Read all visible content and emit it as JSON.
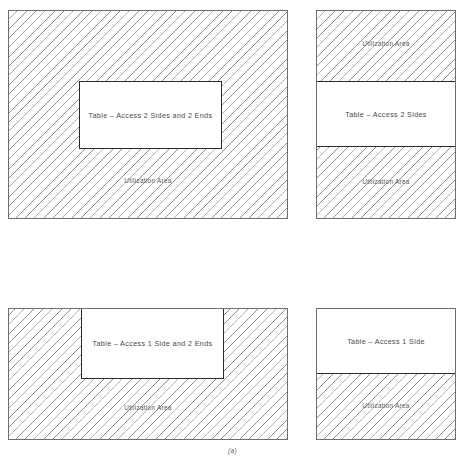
{
  "figure": {
    "caption": "(a)"
  },
  "panels": [
    {
      "id": "top-left",
      "table_label": "Table – Access 2 Sides and 2 Ends",
      "utilization_labels": [
        "Utilization Area"
      ]
    },
    {
      "id": "top-right",
      "table_label": "Table – Access 2 Sides",
      "utilization_labels": [
        "Utilization Area",
        "Utilization Area"
      ]
    },
    {
      "id": "bottom-left",
      "table_label": "Table – Access 1 Side and 2 Ends",
      "utilization_labels": [
        "Utilization Area"
      ]
    },
    {
      "id": "bottom-right",
      "table_label": "Table – Access 1 Side",
      "utilization_labels": [
        "Utilization Area"
      ]
    }
  ],
  "colors": {
    "hatch_line": "#8d8d8d",
    "panel_border": "#6e6e6e",
    "table_border": "#2b2b2b",
    "text": "#4a4a4a",
    "background": "#ffffff"
  }
}
